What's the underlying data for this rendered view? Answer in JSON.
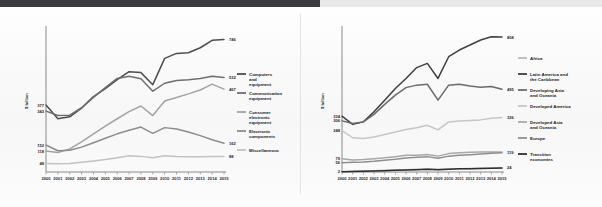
{
  "figure": {
    "y_axis_title": "$ billion",
    "x_tick_labels": [
      "2000",
      "2001",
      "2002",
      "2003",
      "2004",
      "2005",
      "2006",
      "2007",
      "2008",
      "2009",
      "2010",
      "2011",
      "2012",
      "2013",
      "2014",
      "2015"
    ]
  },
  "chart_data": [
    {
      "type": "line",
      "title": "",
      "xlabel": "",
      "ylabel": "$ billion",
      "x": [
        2000,
        2001,
        2002,
        2003,
        2004,
        2005,
        2006,
        2007,
        2008,
        2009,
        2010,
        2011,
        2012,
        2013,
        2014,
        2015
      ],
      "xlim": [
        2000,
        2015
      ],
      "ylim": [
        0,
        800
      ],
      "grid": false,
      "legend_position": "right",
      "start_labels": [
        "377",
        "343",
        "152",
        "118",
        "48"
      ],
      "end_labels": [
        "746",
        "532",
        "467",
        "162",
        "88"
      ],
      "series": [
        {
          "name": "Computers and equipment",
          "color": "#4d4d4d",
          "start_value": 377,
          "end_value": 746,
          "values": [
            377,
            300,
            311,
            360,
            425,
            470,
            520,
            565,
            560,
            492,
            640,
            668,
            672,
            700,
            742,
            746
          ]
        },
        {
          "name": "Communication equipment",
          "color": "#6e6e6e",
          "start_value": 343,
          "end_value": 532,
          "values": [
            343,
            318,
            320,
            362,
            420,
            475,
            527,
            540,
            525,
            455,
            500,
            515,
            520,
            527,
            540,
            532
          ]
        },
        {
          "name": "Consumer electronic equipment",
          "color": "#a3a3a3",
          "start_value": 118,
          "end_value": 467,
          "values": [
            118,
            110,
            130,
            170,
            215,
            258,
            300,
            340,
            372,
            318,
            400,
            420,
            440,
            462,
            495,
            467
          ]
        },
        {
          "name": "Electronic components",
          "color": "#8c8c8c",
          "start_value": 152,
          "end_value": 162,
          "values": [
            152,
            120,
            122,
            140,
            165,
            190,
            215,
            235,
            253,
            218,
            250,
            242,
            225,
            205,
            182,
            162
          ]
        },
        {
          "name": "Miscellaneous",
          "color": "#c2c2c2",
          "start_value": 48,
          "end_value": 88,
          "values": [
            48,
            46,
            48,
            55,
            62,
            70,
            80,
            92,
            88,
            80,
            92,
            88,
            86,
            86,
            88,
            88
          ]
        }
      ]
    },
    {
      "type": "line",
      "title": "",
      "xlabel": "",
      "ylabel": "$ billion",
      "x": [
        2000,
        2001,
        2002,
        2003,
        2004,
        2005,
        2006,
        2007,
        2008,
        2009,
        2010,
        2011,
        2012,
        2013,
        2014,
        2015
      ],
      "xlim": [
        2000,
        2015
      ],
      "ylim": [
        0,
        850
      ],
      "grid": false,
      "legend_position": "right",
      "start_labels": [
        "334",
        "306",
        "248",
        "79",
        "56",
        "2"
      ],
      "end_labels": [
        "808",
        "495",
        "326",
        "119",
        "24"
      ],
      "series": [
        {
          "name": "Africa",
          "color": "#b9b9b9",
          "start_value": 2,
          "end_value": 24,
          "values": [
            2,
            4,
            6,
            8,
            10,
            12,
            14,
            16,
            18,
            16,
            18,
            20,
            21,
            22,
            23,
            24
          ]
        },
        {
          "name": "Latin America and the Caribbean",
          "color": "#3f3f3f",
          "start_value": 334,
          "end_value": 808,
          "values": [
            334,
            285,
            300,
            360,
            430,
            500,
            560,
            625,
            650,
            560,
            690,
            730,
            760,
            790,
            810,
            808
          ]
        },
        {
          "name": "Developing Asia and Oceania",
          "color": "#6b6b6b",
          "start_value": 306,
          "end_value": 495,
          "values": [
            306,
            290,
            300,
            345,
            405,
            460,
            505,
            520,
            525,
            430,
            520,
            525,
            515,
            508,
            512,
            495
          ]
        },
        {
          "name": "Developed America",
          "color": "#c6c6c6",
          "start_value": 248,
          "end_value": 326,
          "values": [
            248,
            205,
            200,
            210,
            225,
            240,
            255,
            265,
            280,
            252,
            300,
            305,
            308,
            312,
            322,
            326
          ]
        },
        {
          "name": "Developed Asia and Oceania",
          "color": "#a8a8a8",
          "start_value": 79,
          "end_value": 119,
          "values": [
            79,
            72,
            75,
            80,
            85,
            92,
            100,
            100,
            105,
            95,
            110,
            115,
            118,
            120,
            120,
            119
          ]
        },
        {
          "name": "Europe",
          "color": "#8f8f8f",
          "start_value": 56,
          "end_value": 119,
          "values": [
            56,
            58,
            60,
            64,
            70,
            76,
            84,
            88,
            92,
            82,
            95,
            100,
            104,
            108,
            112,
            115
          ]
        },
        {
          "name": "Transition economies",
          "color": "#2e2e2e",
          "start_value": 2,
          "end_value": 24,
          "values": [
            2,
            3,
            4,
            6,
            8,
            10,
            12,
            14,
            16,
            14,
            17,
            19,
            20,
            21,
            23,
            24
          ]
        }
      ]
    }
  ],
  "legends": [
    {
      "items": [
        {
          "label": "Computers and equipment",
          "color": "#4d4d4d"
        },
        {
          "label": "Communication equipment",
          "color": "#6e6e6e"
        },
        {
          "label": "Consumer electronic equipment",
          "color": "#a3a3a3"
        },
        {
          "label": "Electronic components",
          "color": "#8c8c8c"
        },
        {
          "label": "Miscellaneous",
          "color": "#c2c2c2"
        }
      ]
    },
    {
      "items": [
        {
          "label": "Africa",
          "color": "#b9b9b9"
        },
        {
          "label": "Latin America and the Caribbean",
          "color": "#3f3f3f"
        },
        {
          "label": "Developing Asia and Oceania",
          "color": "#6b6b6b"
        },
        {
          "label": "Developed America",
          "color": "#c6c6c6"
        },
        {
          "label": "Developed Asia and Oceania",
          "color": "#a8a8a8"
        },
        {
          "label": "Europe",
          "color": "#8f8f8f"
        },
        {
          "label": "Transition economies",
          "color": "#2e2e2e"
        }
      ]
    }
  ]
}
